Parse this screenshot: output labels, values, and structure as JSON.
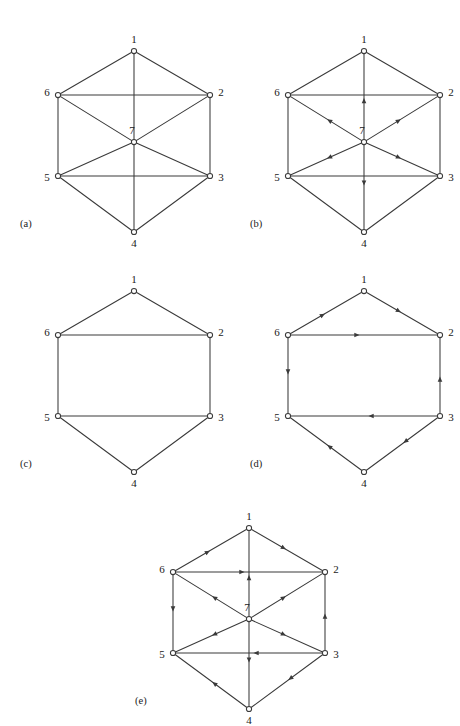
{
  "figure": {
    "width": 460,
    "height": 726,
    "background": "#ffffff",
    "line_color": "#3a3a3a",
    "node_fill": "#ffffff",
    "label_color": "#1a1a1a"
  },
  "node_labels": {
    "n1": "1",
    "n2": "2",
    "n3": "3",
    "n4": "4",
    "n5": "5",
    "n6": "6",
    "n7": "7"
  },
  "captions": {
    "a": "(a)",
    "b": "(b)",
    "c": "(c)",
    "d": "(d)",
    "e": "(e)"
  },
  "node_positions": {
    "1": [
      88,
      14
    ],
    "2": [
      164,
      58
    ],
    "3": [
      164,
      139
    ],
    "4": [
      88,
      195
    ],
    "5": [
      12,
      139
    ],
    "6": [
      12,
      58
    ],
    "7": [
      88,
      105
    ]
  },
  "label_offsets": {
    "1": [
      0,
      -11
    ],
    "2": [
      11,
      -2
    ],
    "3": [
      11,
      2
    ],
    "4": [
      0,
      12
    ],
    "5": [
      -11,
      2
    ],
    "6": [
      -11,
      -2
    ],
    "7": [
      -2,
      -11
    ]
  },
  "panels": [
    {
      "id": "a",
      "caption": "(a)",
      "origin": [
        32,
        23
      ],
      "caption_pos": [
        20,
        218
      ],
      "has_center_node": true,
      "nodes": [
        "1",
        "2",
        "3",
        "4",
        "5",
        "6",
        "7"
      ],
      "edges": [
        {
          "from": "1",
          "to": "2",
          "directed": false
        },
        {
          "from": "2",
          "to": "3",
          "directed": false
        },
        {
          "from": "3",
          "to": "4",
          "directed": false
        },
        {
          "from": "4",
          "to": "5",
          "directed": false
        },
        {
          "from": "5",
          "to": "6",
          "directed": false
        },
        {
          "from": "6",
          "to": "1",
          "directed": false
        },
        {
          "from": "6",
          "to": "2",
          "directed": false
        },
        {
          "from": "5",
          "to": "3",
          "directed": false
        },
        {
          "from": "7",
          "to": "1",
          "directed": false
        },
        {
          "from": "7",
          "to": "2",
          "directed": false
        },
        {
          "from": "7",
          "to": "3",
          "directed": false
        },
        {
          "from": "7",
          "to": "4",
          "directed": false
        },
        {
          "from": "7",
          "to": "5",
          "directed": false
        },
        {
          "from": "7",
          "to": "6",
          "directed": false
        }
      ]
    },
    {
      "id": "b",
      "caption": "(b)",
      "origin": [
        262,
        23
      ],
      "caption_pos": [
        250,
        218
      ],
      "has_center_node": true,
      "nodes": [
        "1",
        "2",
        "3",
        "4",
        "5",
        "6",
        "7"
      ],
      "edges": [
        {
          "from": "1",
          "to": "2",
          "directed": false
        },
        {
          "from": "2",
          "to": "3",
          "directed": false
        },
        {
          "from": "3",
          "to": "4",
          "directed": false
        },
        {
          "from": "4",
          "to": "5",
          "directed": false
        },
        {
          "from": "5",
          "to": "6",
          "directed": false
        },
        {
          "from": "6",
          "to": "1",
          "directed": false
        },
        {
          "from": "6",
          "to": "2",
          "directed": false
        },
        {
          "from": "5",
          "to": "3",
          "directed": false
        },
        {
          "from": "7",
          "to": "1",
          "directed": true
        },
        {
          "from": "7",
          "to": "2",
          "directed": true
        },
        {
          "from": "7",
          "to": "3",
          "directed": true
        },
        {
          "from": "7",
          "to": "4",
          "directed": true
        },
        {
          "from": "7",
          "to": "5",
          "directed": true
        },
        {
          "from": "7",
          "to": "6",
          "directed": true
        }
      ]
    },
    {
      "id": "c",
      "caption": "(c)",
      "origin": [
        32,
        263
      ],
      "caption_pos": [
        20,
        458
      ],
      "has_center_node": false,
      "nodes": [
        "1",
        "2",
        "3",
        "4",
        "5",
        "6"
      ],
      "edges": [
        {
          "from": "1",
          "to": "2",
          "directed": false
        },
        {
          "from": "2",
          "to": "3",
          "directed": false
        },
        {
          "from": "3",
          "to": "4",
          "directed": false
        },
        {
          "from": "4",
          "to": "5",
          "directed": false
        },
        {
          "from": "5",
          "to": "6",
          "directed": false
        },
        {
          "from": "6",
          "to": "1",
          "directed": false
        },
        {
          "from": "6",
          "to": "2",
          "directed": false
        },
        {
          "from": "5",
          "to": "3",
          "directed": false
        }
      ]
    },
    {
      "id": "d",
      "caption": "(d)",
      "origin": [
        262,
        263
      ],
      "caption_pos": [
        250,
        458
      ],
      "has_center_node": false,
      "nodes": [
        "1",
        "2",
        "3",
        "4",
        "5",
        "6"
      ],
      "edges": [
        {
          "from": "6",
          "to": "1",
          "directed": true
        },
        {
          "from": "1",
          "to": "2",
          "directed": true
        },
        {
          "from": "6",
          "to": "2",
          "directed": true
        },
        {
          "from": "6",
          "to": "5",
          "directed": true
        },
        {
          "from": "3",
          "to": "2",
          "directed": true
        },
        {
          "from": "3",
          "to": "5",
          "directed": true
        },
        {
          "from": "3",
          "to": "4",
          "directed": true
        },
        {
          "from": "4",
          "to": "5",
          "directed": true
        }
      ]
    },
    {
      "id": "e",
      "caption": "(e)",
      "origin": [
        147,
        500
      ],
      "caption_pos": [
        135,
        695
      ],
      "has_center_node": true,
      "nodes": [
        "1",
        "2",
        "3",
        "4",
        "5",
        "6",
        "7"
      ],
      "edges": [
        {
          "from": "6",
          "to": "1",
          "directed": true
        },
        {
          "from": "1",
          "to": "2",
          "directed": true
        },
        {
          "from": "6",
          "to": "2",
          "directed": true
        },
        {
          "from": "6",
          "to": "5",
          "directed": true
        },
        {
          "from": "3",
          "to": "2",
          "directed": true
        },
        {
          "from": "3",
          "to": "5",
          "directed": true
        },
        {
          "from": "3",
          "to": "4",
          "directed": true
        },
        {
          "from": "4",
          "to": "5",
          "directed": true
        },
        {
          "from": "7",
          "to": "1",
          "directed": true
        },
        {
          "from": "7",
          "to": "2",
          "directed": true
        },
        {
          "from": "7",
          "to": "3",
          "directed": true
        },
        {
          "from": "7",
          "to": "4",
          "directed": true
        },
        {
          "from": "7",
          "to": "5",
          "directed": true
        },
        {
          "from": "7",
          "to": "6",
          "directed": true
        }
      ]
    }
  ]
}
